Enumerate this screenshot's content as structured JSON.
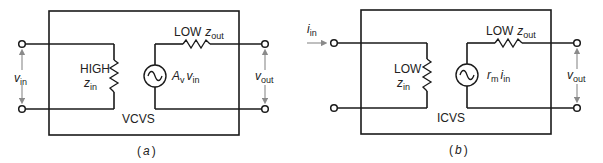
{
  "diagram": {
    "colors": {
      "line": "#1a1a1a",
      "arrow": "#8a8a8a",
      "text": "#222222",
      "background": "#ffffff"
    },
    "panels": [
      {
        "id": "a",
        "caption_open": "(",
        "caption_letter": "a",
        "caption_close": ")",
        "box_label": "VCVS",
        "input_label_symbol": "v",
        "input_label_sub": "in",
        "input_kind": "voltage",
        "zin_level": "HIGH",
        "zin_symbol": "z",
        "zin_sub": "in",
        "zout_level": "LOW",
        "zout_symbol": "z",
        "zout_sub": "out",
        "source_gain_symbol": "A",
        "source_gain_sub": "v",
        "source_input_symbol": "v",
        "source_input_sub": "in",
        "output_label_symbol": "v",
        "output_label_sub": "out"
      },
      {
        "id": "b",
        "caption_open": "(",
        "caption_letter": "b",
        "caption_close": ")",
        "box_label": "ICVS",
        "input_label_symbol": "i",
        "input_label_sub": "in",
        "input_kind": "current",
        "zin_level": "LOW",
        "zin_symbol": "z",
        "zin_sub": "in",
        "zout_level": "LOW",
        "zout_symbol": "z",
        "zout_sub": "out",
        "source_gain_symbol": "r",
        "source_gain_sub": "m",
        "source_input_symbol": "i",
        "source_input_sub": "in",
        "output_label_symbol": "v",
        "output_label_sub": "out"
      }
    ]
  }
}
